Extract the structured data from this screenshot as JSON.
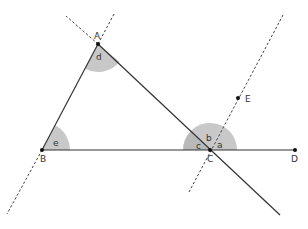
{
  "diagram": {
    "type": "geometry",
    "colors": {
      "line": "#333333",
      "dashed": "#444444",
      "angle_fill": "#c8c8c8",
      "angle_fill_dark": "#b4b4b4",
      "point": "#111111"
    },
    "points": [
      {
        "name": "A",
        "label": "A",
        "x": 98,
        "y": 44
      },
      {
        "name": "B",
        "label": "B",
        "x": 42,
        "y": 150
      },
      {
        "name": "C",
        "label": "C",
        "x": 210,
        "y": 150
      },
      {
        "name": "D",
        "label": "D",
        "x": 295,
        "y": 150
      },
      {
        "name": "E",
        "label": "E",
        "x": 238,
        "y": 98
      }
    ],
    "angles": [
      {
        "label": "a",
        "vertex": "C"
      },
      {
        "label": "b",
        "vertex": "C"
      },
      {
        "label": "c",
        "vertex": "C"
      },
      {
        "label": "d",
        "vertex": "A"
      },
      {
        "label": "e",
        "vertex": "B"
      }
    ],
    "segments": [
      "AB",
      "AC",
      "BD"
    ],
    "dashed_lines": [
      "line AB extended",
      "line CE (parallel to AB)",
      "line AC extended beyond A"
    ]
  }
}
